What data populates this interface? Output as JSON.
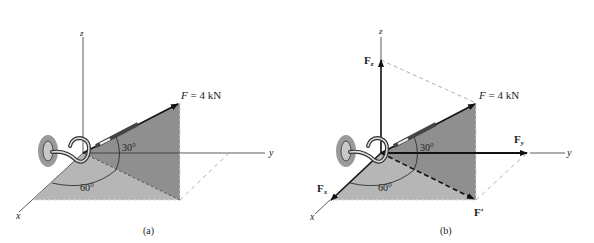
{
  "figure_a": {
    "caption": "(a)",
    "force_label": "F = 4 kN",
    "force_symbol": "F",
    "force_value": "= 4 kN",
    "angle_elevation": "30°",
    "angle_plane": "60°",
    "axes": {
      "x": "x",
      "y": "y",
      "z": "z"
    }
  },
  "figure_b": {
    "caption": "(b)",
    "force_symbol": "F",
    "force_value": "= 4 kN",
    "angle_elevation": "30°",
    "angle_plane": "60°",
    "components": {
      "Fx": "F",
      "Fx_sub": "x",
      "Fy": "F",
      "Fy_sub": "y",
      "Fz": "F",
      "Fz_sub": "z",
      "Fprime": "F′"
    },
    "axes": {
      "x": "x",
      "y": "y",
      "z": "z"
    }
  },
  "colors": {
    "floor_plane": "#b4b4b4",
    "vertical_plane": "#8e8e8e",
    "wall_patch": "#9a9a9a",
    "lines": "#1a1a1a"
  }
}
